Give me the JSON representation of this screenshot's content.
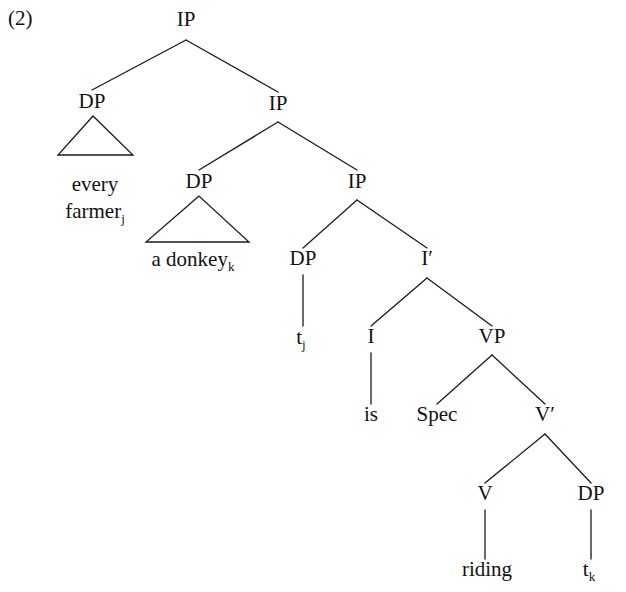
{
  "figure": {
    "example_number": "(2)",
    "width": 626,
    "height": 592,
    "background_color": "#ffffff",
    "line_color": "#1a1a1a",
    "text_color": "#111111"
  },
  "tree": {
    "sentence": "every farmer is riding a donkey",
    "nodes": [
      {
        "id": "ip-root",
        "label": "IP",
        "x": 186,
        "y": 26,
        "type": "nonterminal"
      },
      {
        "id": "dp-1",
        "label": "DP",
        "x": 92,
        "y": 108,
        "type": "nonterminal"
      },
      {
        "id": "ip-2",
        "label": "IP",
        "x": 278,
        "y": 110,
        "type": "nonterminal"
      },
      {
        "id": "dp-2",
        "label": "DP",
        "x": 199,
        "y": 188,
        "type": "nonterminal"
      },
      {
        "id": "ip-3",
        "label": "IP",
        "x": 357,
        "y": 188,
        "type": "nonterminal"
      },
      {
        "id": "dp-3",
        "label": "DP",
        "x": 303,
        "y": 265,
        "type": "nonterminal"
      },
      {
        "id": "ibar",
        "label": "I′",
        "x": 427,
        "y": 265,
        "type": "nonterminal"
      },
      {
        "id": "i-head",
        "label": "I",
        "x": 371,
        "y": 343,
        "type": "nonterminal"
      },
      {
        "id": "vp",
        "label": "VP",
        "x": 492,
        "y": 343,
        "type": "nonterminal"
      },
      {
        "id": "spec",
        "label": "Spec",
        "x": 437,
        "y": 421,
        "type": "nonterminal"
      },
      {
        "id": "vbar",
        "label": "V′",
        "x": 545,
        "y": 421,
        "type": "nonterminal"
      },
      {
        "id": "v-head",
        "label": "V",
        "x": 485,
        "y": 500,
        "type": "nonterminal"
      },
      {
        "id": "dp-4",
        "label": "DP",
        "x": 591,
        "y": 500,
        "type": "nonterminal"
      }
    ],
    "leaves": [
      {
        "id": "leaf-every-farmer",
        "lines": [
          "every",
          "farmer"
        ],
        "subscript": "j",
        "subscript_on_line": 1,
        "x": 95,
        "y": 191,
        "line_height": 27
      },
      {
        "id": "leaf-a-donkey",
        "lines": [
          "a donkey"
        ],
        "subscript": "k",
        "subscript_on_line": 0,
        "x": 193,
        "y": 266,
        "line_height": 27
      },
      {
        "id": "leaf-tj",
        "lines": [
          "t"
        ],
        "subscript": "j",
        "subscript_on_line": 0,
        "x": 301,
        "y": 344,
        "line_height": 27
      },
      {
        "id": "leaf-is",
        "lines": [
          "is"
        ],
        "subscript": "",
        "subscript_on_line": -1,
        "x": 371,
        "y": 421,
        "line_height": 27
      },
      {
        "id": "leaf-riding",
        "lines": [
          "riding"
        ],
        "subscript": "",
        "subscript_on_line": -1,
        "x": 487,
        "y": 576,
        "line_height": 27
      },
      {
        "id": "leaf-tk",
        "lines": [
          "t"
        ],
        "subscript": "k",
        "subscript_on_line": 0,
        "x": 589,
        "y": 576,
        "line_height": 27
      }
    ],
    "branches": [
      {
        "id": "br-root-dp1",
        "from": "ip-root",
        "to": "dp-1",
        "x1": 186,
        "y1": 40,
        "x2": 92,
        "y2": 90
      },
      {
        "id": "br-root-ip2",
        "from": "ip-root",
        "to": "ip-2",
        "x1": 186,
        "y1": 40,
        "x2": 278,
        "y2": 92
      },
      {
        "id": "br-ip2-dp2",
        "from": "ip-2",
        "to": "dp-2",
        "x1": 278,
        "y1": 122,
        "x2": 199,
        "y2": 170
      },
      {
        "id": "br-ip2-ip3",
        "from": "ip-2",
        "to": "ip-3",
        "x1": 278,
        "y1": 122,
        "x2": 357,
        "y2": 170
      },
      {
        "id": "br-ip3-dp3",
        "from": "ip-3",
        "to": "dp-3",
        "x1": 357,
        "y1": 200,
        "x2": 303,
        "y2": 248
      },
      {
        "id": "br-ip3-ibar",
        "from": "ip-3",
        "to": "ibar",
        "x1": 357,
        "y1": 200,
        "x2": 427,
        "y2": 248
      },
      {
        "id": "br-dp3-tj",
        "from": "dp-3",
        "to": "leaf-tj",
        "x1": 303,
        "y1": 275,
        "x2": 303,
        "y2": 326
      },
      {
        "id": "br-ibar-i",
        "from": "ibar",
        "to": "i-head",
        "x1": 427,
        "y1": 278,
        "x2": 371,
        "y2": 326
      },
      {
        "id": "br-ibar-vp",
        "from": "ibar",
        "to": "vp",
        "x1": 427,
        "y1": 278,
        "x2": 492,
        "y2": 326
      },
      {
        "id": "br-i-is",
        "from": "i-head",
        "to": "leaf-is",
        "x1": 371,
        "y1": 353,
        "x2": 371,
        "y2": 404
      },
      {
        "id": "br-vp-spec",
        "from": "vp",
        "to": "spec",
        "x1": 492,
        "y1": 355,
        "x2": 437,
        "y2": 404
      },
      {
        "id": "br-vp-vbar",
        "from": "vp",
        "to": "vbar",
        "x1": 492,
        "y1": 355,
        "x2": 545,
        "y2": 404
      },
      {
        "id": "br-vbar-v",
        "from": "vbar",
        "to": "v-head",
        "x1": 545,
        "y1": 434,
        "x2": 485,
        "y2": 483
      },
      {
        "id": "br-vbar-dp4",
        "from": "vbar",
        "to": "dp-4",
        "x1": 545,
        "y1": 434,
        "x2": 591,
        "y2": 483
      },
      {
        "id": "br-v-riding",
        "from": "v-head",
        "to": "leaf-riding",
        "x1": 485,
        "y1": 510,
        "x2": 485,
        "y2": 559
      },
      {
        "id": "br-dp4-tk",
        "from": "dp-4",
        "to": "leaf-tk",
        "x1": 591,
        "y1": 510,
        "x2": 591,
        "y2": 559
      }
    ],
    "triangles": [
      {
        "id": "tri-every-farmer",
        "parent": "dp-1",
        "apex_x": 93,
        "apex_y": 116,
        "left_x": 58,
        "right_x": 133,
        "base_y": 155
      },
      {
        "id": "tri-a-donkey",
        "parent": "dp-2",
        "apex_x": 199,
        "apex_y": 196,
        "left_x": 146,
        "right_x": 249,
        "base_y": 242
      }
    ]
  }
}
